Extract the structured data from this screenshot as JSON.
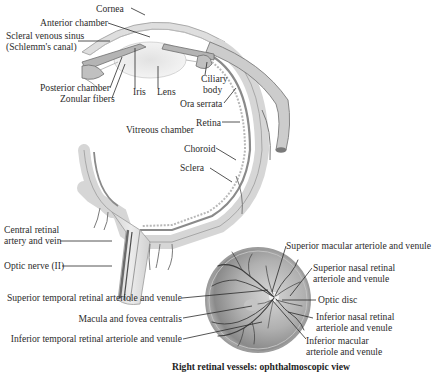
{
  "diagram": {
    "colors": {
      "background": "#ffffff",
      "tissue_light": "#e8e8e8",
      "tissue_mid": "#c8c8c8",
      "tissue_dark": "#8c8c8c",
      "vessel": "#4a4a4a",
      "leader_line": "#2a2a2a",
      "fundus_outer": "#9a9a9a",
      "fundus_inner": "#bdbdbd",
      "optic_disc": "#f0f0f0"
    },
    "eye_section": {
      "labels": [
        {
          "id": "cornea",
          "text": "Cornea"
        },
        {
          "id": "anterior_chamber",
          "text": "Anterior chamber"
        },
        {
          "id": "scleral_venous_sinus_1",
          "text": "Scleral venous sinus"
        },
        {
          "id": "scleral_venous_sinus_2",
          "text": "(Schlemm's canal)"
        },
        {
          "id": "posterior_chamber",
          "text": "Posterior chamber"
        },
        {
          "id": "zonular_fibers",
          "text": "Zonular fibers"
        },
        {
          "id": "iris",
          "text": "Iris"
        },
        {
          "id": "lens",
          "text": "Lens"
        },
        {
          "id": "ciliary_body_1",
          "text": "Ciliary"
        },
        {
          "id": "ciliary_body_2",
          "text": "body"
        },
        {
          "id": "ora_serrata",
          "text": "Ora serrata"
        },
        {
          "id": "retina",
          "text": "Retina"
        },
        {
          "id": "vitreous_chamber",
          "text": "Vitreous chamber"
        },
        {
          "id": "choroid",
          "text": "Choroid"
        },
        {
          "id": "sclera",
          "text": "Sclera"
        },
        {
          "id": "central_retinal_1",
          "text": "Central retinal"
        },
        {
          "id": "central_retinal_2",
          "text": "artery and vein"
        },
        {
          "id": "optic_nerve",
          "text": "Optic nerve (II)"
        }
      ]
    },
    "fundus_view": {
      "caption": "Right retinal vessels: ophthalmoscopic view",
      "labels": [
        {
          "id": "superior_macular",
          "text": "Superior macular arteriole and venule"
        },
        {
          "id": "superior_nasal_1",
          "text": "Superior nasal retinal"
        },
        {
          "id": "superior_nasal_2",
          "text": "arteriole and venule"
        },
        {
          "id": "optic_disc",
          "text": "Optic disc"
        },
        {
          "id": "inferior_nasal_1",
          "text": "Inferior nasal retinal"
        },
        {
          "id": "inferior_nasal_2",
          "text": "arteriole and venule"
        },
        {
          "id": "inferior_macular_1",
          "text": "Inferior macular"
        },
        {
          "id": "inferior_macular_2",
          "text": "arteriole and venule"
        },
        {
          "id": "superior_temporal",
          "text": "Superior temporal retinal arteriole and venule"
        },
        {
          "id": "macula_fovea",
          "text": "Macula and fovea centralis"
        },
        {
          "id": "inferior_temporal",
          "text": "Inferior temporal retinal arteriole and venule"
        }
      ]
    }
  }
}
